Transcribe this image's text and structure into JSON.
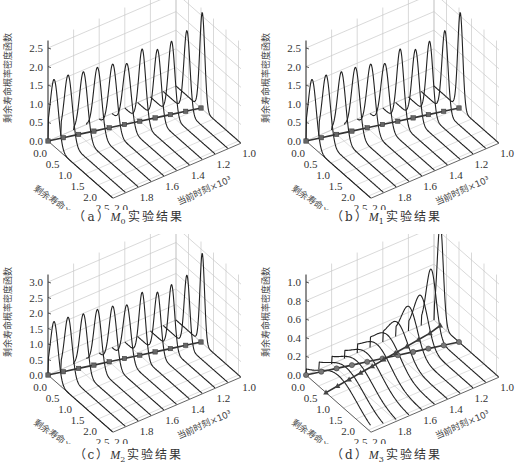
{
  "figure": {
    "panels": [
      {
        "id": "a",
        "caption_prefix": "（a）",
        "model": "M",
        "model_sub": "0",
        "caption_suffix": "实验结果"
      },
      {
        "id": "b",
        "caption_prefix": "（b）",
        "model": "M",
        "model_sub": "1",
        "caption_suffix": "实验结果"
      },
      {
        "id": "c",
        "caption_prefix": "（c）",
        "model": "M",
        "model_sub": "2",
        "caption_suffix": "实验结果"
      },
      {
        "id": "d",
        "caption_prefix": "（d）",
        "model": "M",
        "model_sub": "3",
        "caption_suffix": "实验结果"
      }
    ]
  },
  "chart_data": [
    {
      "type": "line",
      "subtype": "3d-waterfall",
      "title": "(a) M0 实验结果",
      "xlabel": "剩余寿命×10³",
      "ylabel": "当前时刻×10³",
      "zlabel": "剩余寿命概率密度函数",
      "x_ticks": [
        0.0,
        0.5,
        1.0,
        1.5,
        2.0,
        2.5
      ],
      "y_ticks": [
        1.0,
        1.2,
        1.4,
        1.6,
        1.8,
        2.0
      ],
      "z_ticks": [
        0.0,
        0.5,
        1.0,
        1.5,
        2.0,
        2.5
      ],
      "zlim": [
        0,
        2.8
      ],
      "grid": true,
      "current_times": [
        1.0,
        1.1,
        1.2,
        1.3,
        1.4,
        1.5,
        1.6,
        1.7,
        1.8,
        1.9,
        2.0
      ],
      "peak_heights": [
        2.6,
        2.2,
        2.0,
        1.9,
        2.0,
        1.7,
        1.8,
        1.8,
        1.8,
        1.8,
        1.8
      ],
      "peak_locations": [
        1.05,
        0.95,
        0.85,
        0.8,
        0.7,
        0.6,
        0.55,
        0.45,
        0.4,
        0.3,
        0.25
      ],
      "spread": [
        0.1,
        0.12,
        0.13,
        0.14,
        0.14,
        0.16,
        0.16,
        0.16,
        0.16,
        0.16,
        0.16
      ],
      "marker_series": [
        {
          "name": "actual RUL",
          "marker": "square",
          "values": [
            1.0,
            0.9,
            0.8,
            0.7,
            0.6,
            0.5,
            0.4,
            0.3,
            0.2,
            0.1,
            0.0
          ]
        }
      ]
    },
    {
      "type": "line",
      "subtype": "3d-waterfall",
      "title": "(b) M1 实验结果",
      "xlabel": "剩余寿命×10³",
      "ylabel": "当前时刻×10³",
      "zlabel": "剩余寿命概率密度函数",
      "x_ticks": [
        0.0,
        0.5,
        1.0,
        1.5,
        2.0,
        2.5
      ],
      "y_ticks": [
        1.0,
        1.2,
        1.4,
        1.6,
        1.8,
        2.0
      ],
      "z_ticks": [
        0.0,
        0.5,
        1.0,
        1.5,
        2.0,
        2.5
      ],
      "zlim": [
        0,
        2.8
      ],
      "grid": true,
      "current_times": [
        1.0,
        1.1,
        1.2,
        1.3,
        1.4,
        1.5,
        1.6,
        1.7,
        1.8,
        1.9,
        2.0
      ],
      "peak_heights": [
        2.6,
        2.2,
        2.0,
        1.9,
        2.0,
        1.7,
        1.8,
        1.8,
        1.8,
        1.8,
        1.8
      ],
      "peak_locations": [
        1.05,
        0.95,
        0.85,
        0.8,
        0.7,
        0.6,
        0.55,
        0.45,
        0.4,
        0.3,
        0.25
      ],
      "spread": [
        0.1,
        0.12,
        0.13,
        0.14,
        0.14,
        0.16,
        0.16,
        0.16,
        0.16,
        0.16,
        0.16
      ],
      "marker_series": [
        {
          "name": "actual RUL",
          "marker": "square",
          "values": [
            1.0,
            0.9,
            0.8,
            0.7,
            0.6,
            0.5,
            0.4,
            0.3,
            0.2,
            0.1,
            0.0
          ]
        }
      ]
    },
    {
      "type": "line",
      "subtype": "3d-waterfall",
      "title": "(c) M2 实验结果",
      "xlabel": "剩余寿命×10³",
      "ylabel": "当前时刻×10³",
      "zlabel": "剩余寿命概率密度函数",
      "x_ticks": [
        0.0,
        0.5,
        1.0,
        1.5,
        2.0,
        2.5
      ],
      "y_ticks": [
        1.0,
        1.2,
        1.4,
        1.6,
        1.8,
        2.0
      ],
      "z_ticks": [
        0.0,
        0.5,
        1.0,
        1.5,
        2.0,
        2.5,
        3.0
      ],
      "zlim": [
        0,
        3.2
      ],
      "grid": true,
      "current_times": [
        1.0,
        1.1,
        1.2,
        1.3,
        1.4,
        1.5,
        1.6,
        1.7,
        1.8,
        1.9,
        2.0
      ],
      "peak_heights": [
        2.9,
        2.3,
        2.1,
        2.0,
        2.1,
        1.8,
        1.9,
        1.9,
        1.9,
        1.9,
        1.9
      ],
      "peak_locations": [
        1.05,
        0.95,
        0.85,
        0.8,
        0.7,
        0.6,
        0.55,
        0.45,
        0.4,
        0.3,
        0.25
      ],
      "spread": [
        0.09,
        0.11,
        0.12,
        0.13,
        0.13,
        0.15,
        0.15,
        0.15,
        0.15,
        0.15,
        0.15
      ],
      "marker_series": [
        {
          "name": "actual RUL",
          "marker": "square",
          "values": [
            1.0,
            0.9,
            0.8,
            0.7,
            0.6,
            0.5,
            0.4,
            0.3,
            0.2,
            0.1,
            0.0
          ]
        }
      ]
    },
    {
      "type": "line",
      "subtype": "3d-waterfall",
      "title": "(d) M3 实验结果",
      "xlabel": "剩余寿命×10³",
      "ylabel": "当前时刻×10³",
      "zlabel": "剩余寿命概率密度函数",
      "x_ticks": [
        0.0,
        0.5,
        1.0,
        1.5,
        2.0,
        2.5
      ],
      "y_ticks": [
        1.0,
        1.2,
        1.4,
        1.6,
        1.8,
        2.0
      ],
      "z_ticks": [
        0.0,
        0.2,
        0.4,
        0.6,
        0.8,
        1.0
      ],
      "zlim": [
        0,
        1.15
      ],
      "grid": true,
      "current_times": [
        1.0,
        1.1,
        1.2,
        1.3,
        1.4,
        1.5,
        1.6,
        1.7,
        1.8,
        1.9,
        2.0
      ],
      "peak_heights": [
        1.1,
        0.7,
        0.5,
        0.45,
        0.35,
        0.3,
        0.28,
        0.27,
        0.27,
        0.28,
        0.3
      ],
      "peak_locations": [
        0.25,
        0.4,
        0.5,
        0.55,
        0.6,
        0.7,
        0.8,
        0.9,
        1.0,
        1.1,
        1.3
      ],
      "spread": [
        0.12,
        0.2,
        0.28,
        0.32,
        0.4,
        0.5,
        0.55,
        0.6,
        0.65,
        0.7,
        0.75
      ],
      "marker_series": [
        {
          "name": "actual RUL",
          "marker": "circle",
          "values": [
            1.0,
            0.9,
            0.8,
            0.7,
            0.6,
            0.5,
            0.4,
            0.3,
            0.2,
            0.1,
            0.0
          ]
        },
        {
          "name": "predicted RUL",
          "marker": "triangle",
          "values": [
            0.25,
            0.35,
            0.4,
            0.45,
            0.5,
            0.55,
            0.6,
            0.65,
            0.7,
            0.75,
            0.8
          ]
        }
      ]
    }
  ]
}
